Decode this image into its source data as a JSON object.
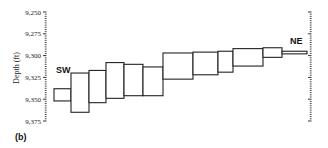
{
  "panel_label": "(b)",
  "chart_data": {
    "type": "box-profile",
    "title": "",
    "xlabel": "",
    "ylabel": "Depth (ft)",
    "ylim": [
      9250,
      9375
    ],
    "y_inverted": true,
    "yticks": [
      9250,
      9275,
      9300,
      9325,
      9350,
      9375
    ],
    "ytick_labels": [
      "9,250",
      "9,275",
      "9,300",
      "9,325",
      "9,350",
      "9,375"
    ],
    "grid": false,
    "left_label": "SW",
    "right_label": "NE",
    "series": [
      {
        "name": "depth interval",
        "segments": [
          {
            "index": 1,
            "top": 9338,
            "bottom": 9352
          },
          {
            "index": 2,
            "top": 9320,
            "bottom": 9365
          },
          {
            "index": 3,
            "top": 9317,
            "bottom": 9354
          },
          {
            "index": 4,
            "top": 9308,
            "bottom": 9349
          },
          {
            "index": 5,
            "top": 9310,
            "bottom": 9346
          },
          {
            "index": 6,
            "top": 9313,
            "bottom": 9346
          },
          {
            "index": 7,
            "top": 9297,
            "bottom": 9327
          },
          {
            "index": 8,
            "top": 9296,
            "bottom": 9322
          },
          {
            "index": 9,
            "top": 9295,
            "bottom": 9319
          },
          {
            "index": 10,
            "top": 9292,
            "bottom": 9312
          },
          {
            "index": 11,
            "top": 9291,
            "bottom": 9302
          },
          {
            "index": 12,
            "top": 9295,
            "bottom": 9298
          }
        ]
      }
    ],
    "segment_x_px": [
      [
        54,
        71
      ],
      [
        71,
        89
      ],
      [
        89,
        106
      ],
      [
        106,
        124
      ],
      [
        124,
        143
      ],
      [
        143,
        163
      ],
      [
        163,
        193
      ],
      [
        193,
        218
      ],
      [
        218,
        233
      ],
      [
        233,
        263
      ],
      [
        263,
        282
      ],
      [
        282,
        307
      ]
    ]
  }
}
